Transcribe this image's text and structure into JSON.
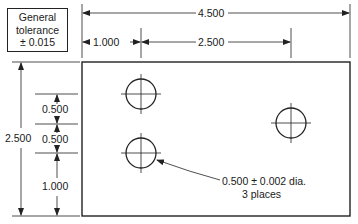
{
  "note_box": {
    "line1": "General",
    "line2": "tolerance",
    "line3": "± 0.015"
  },
  "dimensions": {
    "overall_width": "4.500",
    "left_offset": "1.000",
    "hole_spacing_x": "2.500",
    "overall_height": "2.500",
    "v_spacing_top": "0.500",
    "v_spacing_mid": "0.500",
    "v_spacing_bottom": "1.000"
  },
  "callout": {
    "line1": "0.500 ± 0.002 dia.",
    "line2": "3 places"
  },
  "holes": [
    {
      "id": "hole-top-left",
      "cx": 141,
      "cy": 94
    },
    {
      "id": "hole-bottom-left",
      "cx": 141,
      "cy": 153
    },
    {
      "id": "hole-right",
      "cx": 291,
      "cy": 123
    }
  ],
  "colors": {
    "line": "#222222",
    "background": "#ffffff"
  }
}
